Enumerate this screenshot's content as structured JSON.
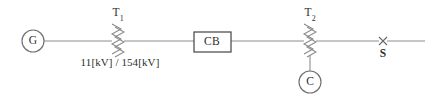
{
  "diagram": {
    "background_color": "#ffffff",
    "line_color": "#8e8e8e",
    "text_color": "#2e2e2e",
    "generator": {
      "label": "G",
      "name": "generator",
      "cx": 33,
      "cy": 41,
      "r": 11
    },
    "transformer_1": {
      "label_main": "T",
      "label_sub": "1",
      "rating": "11[kV] / 154[kV]",
      "cx": 118,
      "label_x": 118,
      "label_y": 14,
      "rating_x": 120,
      "rating_y": 62
    },
    "circuit_breaker": {
      "label": "CB",
      "x": 194,
      "y": 32,
      "width": 37,
      "height": 20,
      "label_x": 212,
      "label_y": 42
    },
    "transformer_2": {
      "label_main": "T",
      "label_sub": "2",
      "cx": 310,
      "label_x": 310,
      "label_y": 14
    },
    "load": {
      "label": "C",
      "name": "capacitor-load",
      "cx": 310,
      "cy": 82,
      "r": 11
    },
    "switch": {
      "label": "S",
      "marker": "x-cross",
      "cx": 383,
      "cy": 41,
      "label_x": 383,
      "label_y": 54
    },
    "bus": {
      "y": 41,
      "x_start": 44,
      "x_end": 425
    }
  }
}
